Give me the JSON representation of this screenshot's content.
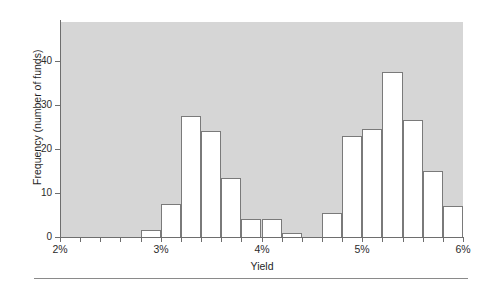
{
  "chart_data": {
    "type": "bar",
    "title": "",
    "subtitle": "",
    "xlabel": "Yield",
    "ylabel": "Frequency (number of funds)",
    "grid": false,
    "legend": null,
    "xlim": [
      2,
      6
    ],
    "ylim": [
      0,
      48
    ],
    "x_tick_labels": [
      "2%",
      "3%",
      "4%",
      "5%",
      "6%"
    ],
    "x_tick_values": [
      2,
      3,
      4,
      5,
      6
    ],
    "y_tick_labels": [
      "0",
      "10",
      "20",
      "30",
      "40"
    ],
    "y_tick_values": [
      0,
      10,
      20,
      30,
      40
    ],
    "bin_width": 0.2,
    "bin_starts": [
      2.8,
      3.0,
      3.2,
      3.4,
      3.6,
      3.8,
      4.0,
      4.2,
      4.4,
      4.6,
      4.8,
      5.0,
      5.2,
      5.4,
      5.6,
      5.8
    ],
    "categories": [
      "2.8%",
      "3.0%",
      "3.2%",
      "3.4%",
      "3.6%",
      "3.8%",
      "4.0%",
      "4.2%",
      "4.4%",
      "4.6%",
      "4.8%",
      "5.0%",
      "5.2%",
      "5.4%",
      "5.6%",
      "5.8%"
    ],
    "values": [
      1.5,
      7.5,
      27.5,
      24,
      13.5,
      4,
      4,
      1,
      0,
      5.5,
      23,
      24.5,
      37.5,
      26.5,
      15,
      7
    ],
    "bar_fill": "#ffffff",
    "bar_edge": "#7a7a7a",
    "plot_background": "#d6d6d6",
    "figure_background": "#ffffff",
    "axis_color": "#6e6e6e"
  },
  "figure": {
    "footer_rule": true
  }
}
